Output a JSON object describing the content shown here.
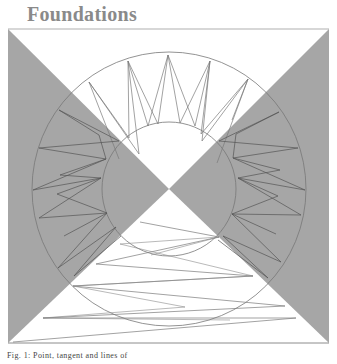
{
  "header": {
    "title": "Foundations"
  },
  "figure": {
    "colors": {
      "shade": "#a6a6a6",
      "line": "#6e6e6e",
      "frame": "#8c8c8c",
      "background": "#ffffff"
    },
    "square": {
      "x1": 8,
      "y1": 29,
      "x2": 329,
      "y2": 343
    },
    "center": {
      "x": 169,
      "y": 189
    },
    "circles": {
      "outer_radius": 137,
      "inner_radius": 67
    }
  },
  "caption": {
    "text": "Fig. 1: Point, tangent and lines of"
  }
}
